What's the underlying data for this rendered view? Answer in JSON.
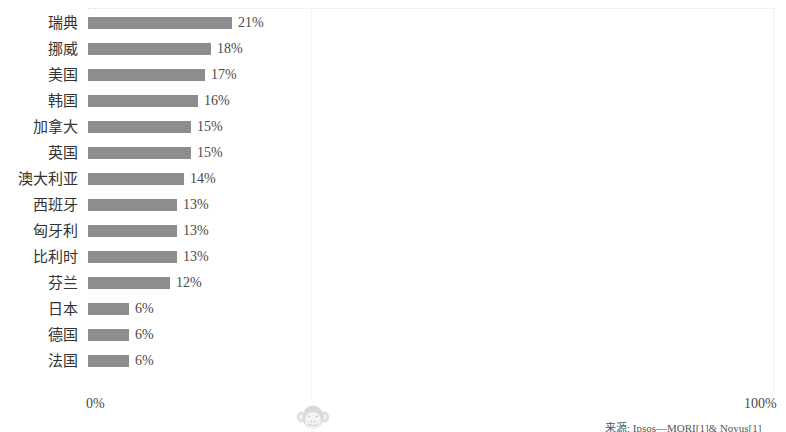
{
  "chart_data": {
    "type": "bar",
    "orientation": "horizontal",
    "title": "",
    "xlabel": "",
    "ylabel": "",
    "xlim": [
      0,
      100
    ],
    "grid": true,
    "legend": "none",
    "categories": [
      "瑞典",
      "挪威",
      "美国",
      "韩国",
      "加拿大",
      "英国",
      "澳大利亚",
      "西班牙",
      "匈牙利",
      "比利时",
      "芬兰",
      "日本",
      "德国",
      "法国"
    ],
    "values": [
      21,
      18,
      17,
      16,
      15,
      15,
      14,
      13,
      13,
      13,
      12,
      6,
      6,
      6
    ],
    "data_labels": [
      "21%",
      "18%",
      "17%",
      "16%",
      "15%",
      "15%",
      "14%",
      "13%",
      "13%",
      "13%",
      "12%",
      "6%",
      "6%",
      "6%"
    ],
    "axis_ticks": [
      "0%",
      "100%"
    ],
    "bar_color": "#8d8d8d"
  },
  "axis": {
    "left_label": "0%",
    "right_label": "100%"
  },
  "footer": {
    "source": "来源: Ipsos—MORI[1]& Novus[1]"
  },
  "watermark": {
    "name": "monkey-face"
  },
  "title_fragment": ""
}
